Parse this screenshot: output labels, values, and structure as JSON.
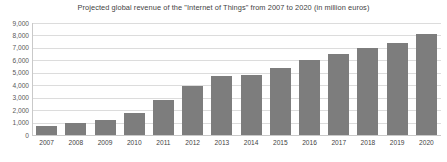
{
  "chart_data": {
    "type": "bar",
    "title": "Projected global revenue of the \"Internet of Things\" from 2007 to 2020 (in million euros)",
    "xlabel": "",
    "ylabel": "",
    "categories": [
      "2007",
      "2008",
      "2009",
      "2010",
      "2011",
      "2012",
      "2013",
      "2014",
      "2015",
      "2016",
      "2017",
      "2018",
      "2019",
      "2020"
    ],
    "values": [
      700,
      1000,
      1200,
      1800,
      2800,
      3900,
      4750,
      4800,
      5400,
      6000,
      6500,
      7000,
      7400,
      8100
    ],
    "ylim": [
      0,
      9000
    ],
    "ytick_labels": [
      "9,000",
      "8,000",
      "7,000",
      "6,000",
      "5,000",
      "4,000",
      "3,000",
      "2,000",
      "1,000",
      "0"
    ],
    "ytick_values": [
      9000,
      8000,
      7000,
      6000,
      5000,
      4000,
      3000,
      2000,
      1000,
      0
    ],
    "grid": true,
    "legend": false,
    "bar_color": "#7d7d7d",
    "grid_color": "#dcdcdc",
    "background_color": "#ffffff"
  }
}
